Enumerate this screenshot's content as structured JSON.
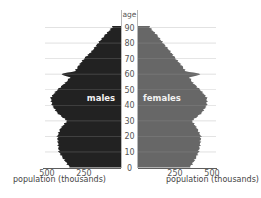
{
  "chart_data": {
    "type": "bar",
    "subtype": "population-pyramid",
    "title": "",
    "y_axis_label": "age",
    "age_ticks": [
      0,
      10,
      20,
      30,
      40,
      50,
      60,
      70,
      80,
      90
    ],
    "x_ticks": [
      250,
      500
    ],
    "xlabel_left": "population (thousands)",
    "xlabel_right": "population (thousands)",
    "series_labels": {
      "male": "males",
      "female": "females"
    },
    "xlim": [
      0,
      500
    ],
    "ylim": [
      0,
      95
    ],
    "grid": true,
    "colors": {
      "male": "#222222",
      "female": "#676767",
      "grid": "#9a9a9a",
      "axis": "#333333"
    },
    "ages": [
      0,
      5,
      10,
      15,
      20,
      25,
      30,
      35,
      40,
      45,
      50,
      55,
      58,
      60,
      62,
      65,
      70,
      75,
      80,
      85,
      90
    ],
    "series": [
      {
        "name": "males",
        "values": [
          345,
          385,
          420,
          425,
          430,
          410,
          365,
          430,
          465,
          475,
          430,
          370,
          345,
          410,
          310,
          290,
          250,
          195,
          155,
          110,
          60
        ]
      },
      {
        "name": "females",
        "values": [
          350,
          385,
          410,
          420,
          425,
          400,
          365,
          430,
          465,
          465,
          420,
          365,
          350,
          430,
          320,
          300,
          255,
          215,
          170,
          130,
          80
        ]
      }
    ]
  }
}
